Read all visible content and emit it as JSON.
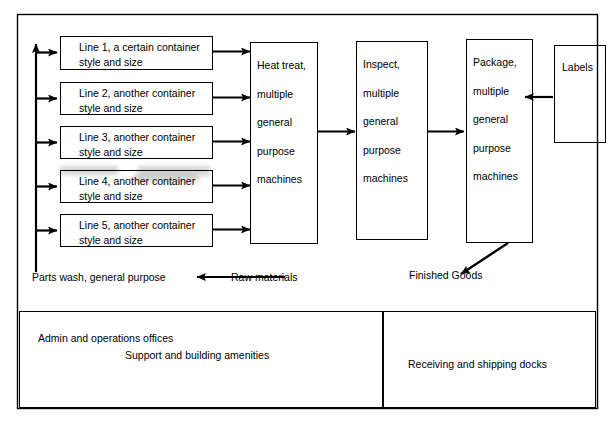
{
  "diagram": {
    "stroke_color": "#000000",
    "background_color": "#ffffff",
    "production_lines": [
      {
        "line1": "Line 1, a certain container",
        "line2": "style and size"
      },
      {
        "line1": "Line 2, another container",
        "line2": "style and size"
      },
      {
        "line1": "Line 3, another container",
        "line2": "style and size"
      },
      {
        "line1": "Line 4, another container",
        "line2": "style and size"
      },
      {
        "line1": "Line 5, another container",
        "line2": "style and size"
      }
    ],
    "process_boxes": [
      {
        "name": "heat-treat",
        "lines": [
          "Heat treat,",
          "multiple",
          "general",
          "purpose",
          "machines"
        ]
      },
      {
        "name": "inspect",
        "lines": [
          "Inspect,",
          "multiple",
          "general",
          "purpose",
          "machines"
        ]
      },
      {
        "name": "package",
        "lines": [
          "Package,",
          "multiple",
          "general",
          "purpose",
          "machines"
        ]
      }
    ],
    "labels_box": {
      "text": "Labels"
    },
    "flow_labels": {
      "parts_wash": "Parts wash, general purpose",
      "raw_materials": "Raw materials",
      "finished_goods": "Finished Goods"
    },
    "facility_areas": {
      "admin_offices": "Admin and operations offices",
      "support_amenities": "Support and building amenities",
      "docks": "Receiving and shipping docks"
    }
  }
}
